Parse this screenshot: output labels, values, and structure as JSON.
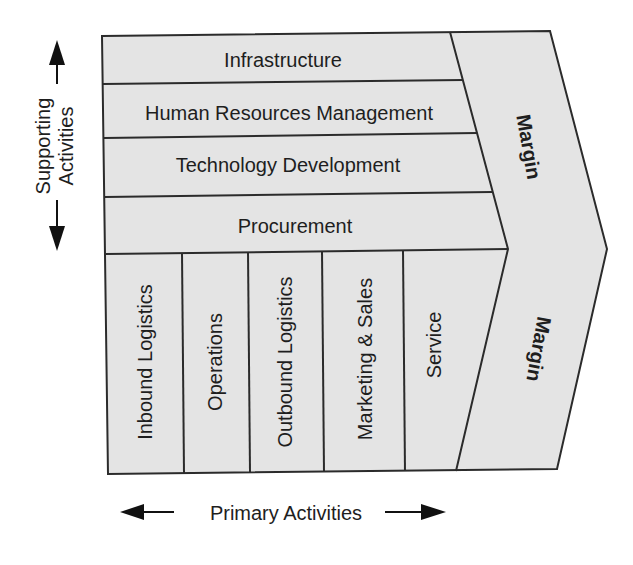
{
  "diagram": {
    "supporting_activities": [
      {
        "label": "Infrastructure"
      },
      {
        "label": "Human Resources Management"
      },
      {
        "label": "Technology Development"
      },
      {
        "label": "Procurement"
      }
    ],
    "primary_activities": [
      {
        "label": "Inbound Logistics"
      },
      {
        "label": "Operations"
      },
      {
        "label": "Outbound Logistics"
      },
      {
        "label": "Marketing & Sales"
      },
      {
        "label": "Service"
      }
    ],
    "margin_top_label": "Margin",
    "margin_bottom_label": "Margin",
    "axis_vertical": {
      "line1": "Supporting",
      "line2": "Activities",
      "icon": "double-arrow-vertical"
    },
    "axis_horizontal": {
      "label": "Primary Activities",
      "icon": "double-arrow-horizontal"
    },
    "colors": {
      "fill": "#e4e4e4",
      "stroke": "#2b2b2b",
      "text": "#1e1e1e"
    }
  }
}
